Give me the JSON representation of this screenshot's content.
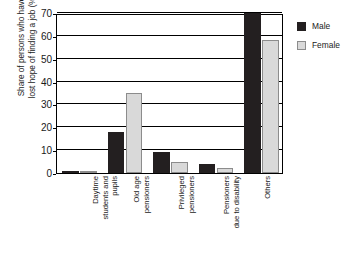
{
  "chart_data": {
    "type": "bar",
    "title": "",
    "xlabel": "",
    "ylabel": "Share of persons who have lost hope of finding a job (%)",
    "ylabel_lines": [
      "Share of persons who have",
      "lost hope of finding a job (%)"
    ],
    "ylim": [
      0,
      70
    ],
    "yticks": [
      0,
      10,
      20,
      30,
      40,
      50,
      60,
      70
    ],
    "ytick_labels": [
      "0",
      "10",
      "20",
      "30",
      "40",
      "50",
      "60",
      "70"
    ],
    "grid": true,
    "legend_position": "right",
    "categories": [
      "Daytime students and pupils",
      "Old age pensioners",
      "Privileged pensioners",
      "Pensioners due to disability",
      "Others"
    ],
    "category_lines": [
      [
        "Daytime",
        "students and",
        "pupils"
      ],
      [
        "Old age",
        "pensioners"
      ],
      [
        "Privileged",
        "pensioners"
      ],
      [
        "Pensioners",
        "due to disability"
      ],
      [
        "Others"
      ]
    ],
    "series": [
      {
        "name": "Male",
        "color": "#231f20",
        "values": [
          1,
          18,
          9,
          4,
          70
        ]
      },
      {
        "name": "Female",
        "color": "#d9d9d9",
        "values": [
          0.3,
          35,
          5,
          2,
          58
        ]
      }
    ]
  },
  "legend": {
    "items": [
      {
        "label": "Male",
        "color": "#231f20"
      },
      {
        "label": "Female",
        "color": "#d9d9d9"
      }
    ]
  }
}
